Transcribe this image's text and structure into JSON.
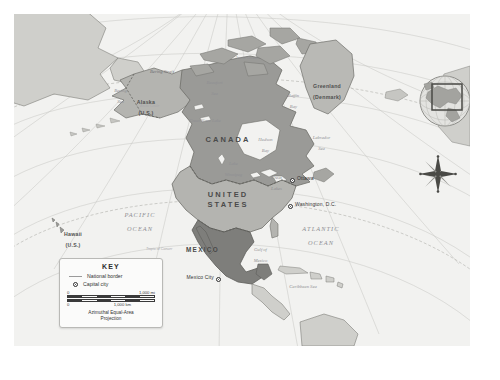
{
  "map": {
    "title": "North America political map",
    "projection_note": "Azimuthal Equal-Area Projection",
    "colors": {
      "land_canada": "#9a9a97",
      "land_usa": "#b4b4b0",
      "land_mexico": "#7e7e7b",
      "land_other": "#cfcfcb",
      "ocean": "#f2f2f0",
      "border": "#6e6e6a",
      "graticule": "#c4c4c0"
    },
    "countries": [
      {
        "name": "CANADA",
        "x": 214,
        "y": 126
      },
      {
        "name": "UNITED",
        "x": 214,
        "y": 181
      },
      {
        "name": "STATES",
        "x": 214,
        "y": 191
      },
      {
        "name": "MEXICO",
        "x": 196,
        "y": 236
      }
    ],
    "territories": [
      {
        "name": "Alaska",
        "sub": "(U.S.)",
        "x": 127,
        "y": 84
      },
      {
        "name": "Hawaii",
        "sub": "(U.S.)",
        "x": 54,
        "y": 216
      },
      {
        "name": "Greenland",
        "sub": "(Denmark)",
        "x": 308,
        "y": 70
      }
    ],
    "capitals": [
      {
        "name": "Ottawa",
        "x": 283,
        "y": 166
      },
      {
        "name": "Washington, D.C.",
        "x": 281,
        "y": 192
      },
      {
        "name": "Mexico City",
        "x": 209,
        "y": 265
      }
    ],
    "oceans": [
      {
        "name": "PACIFIC",
        "line2": "OCEAN",
        "x": 118,
        "y": 201
      },
      {
        "name": "ATLANTIC",
        "line2": "OCEAN",
        "x": 299,
        "y": 215
      }
    ],
    "seas": [
      {
        "name": "Bering Strait",
        "x": 146,
        "y": 58
      },
      {
        "name": "Bering",
        "line2": "Sea",
        "x": 102,
        "y": 73
      },
      {
        "name": "Beaufort",
        "line2": "Sea",
        "x": 196,
        "y": 65
      },
      {
        "name": "Baffin",
        "line2": "Bay",
        "x": 276,
        "y": 78
      },
      {
        "name": "Great Slave Lake",
        "x": 190,
        "y": 107
      },
      {
        "name": "Hudson",
        "line2": "Bay",
        "x": 248,
        "y": 122
      },
      {
        "name": "Labrador",
        "line2": "Sea",
        "x": 303,
        "y": 120
      },
      {
        "name": "Lake",
        "line2": "Winnipeg",
        "x": 216,
        "y": 146
      },
      {
        "name": "Great",
        "line2": "Lakes",
        "x": 259,
        "y": 160
      },
      {
        "name": "Gulf of",
        "line2": "Mexico",
        "x": 243,
        "y": 232
      },
      {
        "name": "Caribbean Sea",
        "x": 288,
        "y": 272
      },
      {
        "name": "Arctic Ocean",
        "x": 232,
        "y": 44
      }
    ],
    "graticule_labels": [
      {
        "name": "Tropic of Cancer",
        "x": 160,
        "y": 236
      },
      {
        "name": "Arctic Circle",
        "x": 150,
        "y": 93
      }
    ]
  },
  "legend": {
    "title": "KEY",
    "items": [
      {
        "icon": "national-border-line",
        "label": "National border"
      },
      {
        "icon": "capital-city-dot",
        "label": "Capital city"
      }
    ],
    "scale_miles": {
      "min": "0",
      "max": "1,000 mi"
    },
    "scale_km": {
      "min": "0",
      "max": "1,000 km"
    },
    "projection_line1": "Azimuthal Equal-Area",
    "projection_line2": "Projection"
  },
  "inset": {
    "name": "locator-globe",
    "highlight": "North America"
  },
  "compass": {
    "name": "compass-rose",
    "points": 8
  }
}
